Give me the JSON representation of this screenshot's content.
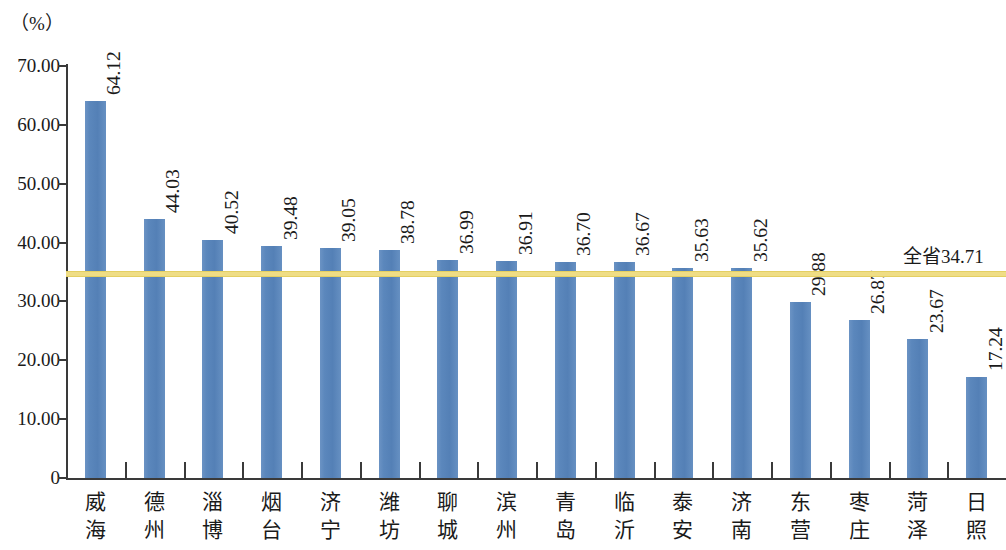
{
  "unit_caption": "（%）",
  "average_label": "全省34.71",
  "colors": {
    "bar": "#5b87bc",
    "average_line": "#efdd85",
    "axis": "#3a3a3a",
    "text": "#1a1a1a"
  },
  "chart_data": {
    "type": "bar",
    "title": "",
    "xlabel": "",
    "ylabel": "（%）",
    "ylim": [
      0,
      70
    ],
    "ytick_labels": [
      "0",
      "10.00",
      "20.00",
      "30.00",
      "40.00",
      "50.00",
      "60.00",
      "70.00"
    ],
    "ytick_values": [
      0,
      10,
      20,
      30,
      40,
      50,
      60,
      70
    ],
    "grid": false,
    "legend": null,
    "categories": [
      "威海",
      "德州",
      "淄博",
      "烟台",
      "济宁",
      "潍坊",
      "聊城",
      "滨州",
      "青岛",
      "临沂",
      "泰安",
      "济南",
      "东营",
      "枣庄",
      "菏泽",
      "日照"
    ],
    "values": [
      64.12,
      44.03,
      40.52,
      39.48,
      39.05,
      38.78,
      36.99,
      36.91,
      36.7,
      36.67,
      35.63,
      35.62,
      29.88,
      26.87,
      23.67,
      17.24
    ],
    "value_labels": [
      "64.12",
      "44.03",
      "40.52",
      "39.48",
      "39.05",
      "38.78",
      "36.99",
      "36.91",
      "36.70",
      "36.67",
      "35.63",
      "35.62",
      "29.88",
      "26.87",
      "23.67",
      "17.24"
    ],
    "annotations": [
      {
        "name": "province-average",
        "type": "hline",
        "value": 34.71,
        "label": "全省34.71",
        "color": "#efdd85"
      }
    ]
  }
}
